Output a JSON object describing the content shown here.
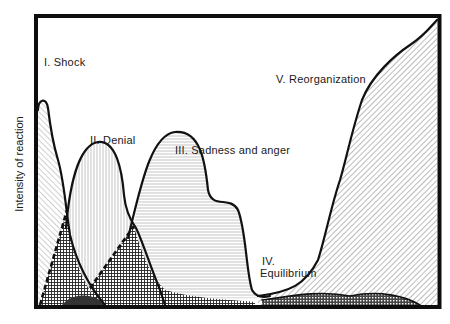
{
  "diagram": {
    "title": "",
    "y_axis_label": "Intensity of reaction",
    "x_axis_label": "",
    "stages": [
      {
        "numeral": "I.",
        "name": "Shock",
        "label": "I.   Shock"
      },
      {
        "numeral": "II.",
        "name": "Denial",
        "label": "II.   Denial"
      },
      {
        "numeral": "III.",
        "name": "Sadness and anger",
        "label": "III.   Sadness and anger"
      },
      {
        "numeral": "IV.",
        "name": "Equilibrium",
        "label_line1": "IV.",
        "label_line2": "Equilibrium"
      },
      {
        "numeral": "V.",
        "name": "Reorganization",
        "label": "V.   Reorganization"
      }
    ],
    "colors": {
      "ink": "#111111",
      "background": "#ffffff"
    }
  }
}
